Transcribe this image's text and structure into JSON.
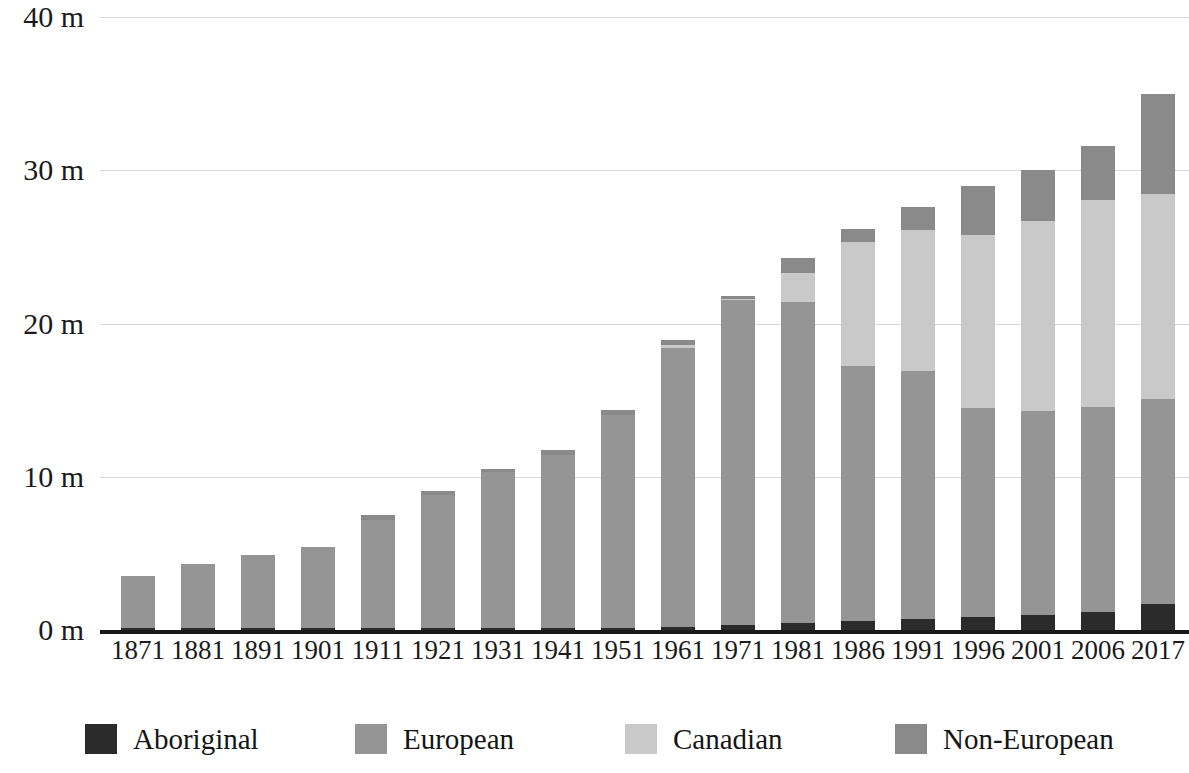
{
  "chart_data": {
    "type": "bar",
    "stacked": true,
    "title": "",
    "subtitle": "",
    "xlabel": "",
    "ylabel": "",
    "grid": true,
    "legend_position": "bottom",
    "ylim": [
      0,
      40
    ],
    "y_ticks": [
      0,
      10,
      20,
      30,
      40
    ],
    "y_tick_labels": [
      "0 m",
      "10 m",
      "20 m",
      "30 m",
      "40 m"
    ],
    "unit_note": "m = millions of people",
    "categories": [
      "1871",
      "1881",
      "1891",
      "1901",
      "1911",
      "1921",
      "1931",
      "1941",
      "1951",
      "1961",
      "1971",
      "1981",
      "1986",
      "1991",
      "1996",
      "2001",
      "2006",
      "2017"
    ],
    "series": [
      {
        "name": "Aboriginal",
        "color": "#2b2b2b",
        "values": [
          0.1,
          0.1,
          0.1,
          0.1,
          0.1,
          0.1,
          0.1,
          0.12,
          0.16,
          0.22,
          0.31,
          0.49,
          0.6,
          0.72,
          0.87,
          1.0,
          1.17,
          1.67
        ]
      },
      {
        "name": "European",
        "color": "#959595",
        "values": [
          3.4,
          4.2,
          4.8,
          5.3,
          7.1,
          8.7,
          10.2,
          11.3,
          13.9,
          18.2,
          21.2,
          20.9,
          16.6,
          16.2,
          13.6,
          13.3,
          13.4,
          13.4
        ]
      },
      {
        "name": "Canadian",
        "color": "#c9c9c9",
        "values": [
          0.0,
          0.0,
          0.0,
          0.0,
          0.0,
          0.0,
          0.0,
          0.0,
          0.0,
          0.2,
          0.1,
          1.9,
          8.1,
          9.2,
          11.3,
          12.4,
          13.5,
          13.4
        ]
      },
      {
        "name": "Non-European",
        "color": "#8a8a8a",
        "values": [
          0.0,
          0.0,
          0.0,
          0.0,
          0.3,
          0.3,
          0.2,
          0.3,
          0.3,
          0.3,
          0.2,
          1.0,
          0.9,
          1.5,
          3.2,
          3.3,
          3.5,
          6.5
        ]
      }
    ],
    "totals": [
      3.5,
      4.3,
      4.9,
      5.4,
      7.5,
      9.1,
      10.5,
      11.7,
      14.4,
      18.9,
      21.8,
      24.3,
      25.2,
      27.6,
      29.0,
      30.0,
      31.5,
      35.0
    ]
  },
  "legend": {
    "items": [
      {
        "label": "Aboriginal",
        "color": "#2b2b2b"
      },
      {
        "label": "European",
        "color": "#959595"
      },
      {
        "label": "Canadian",
        "color": "#c9c9c9"
      },
      {
        "label": "Non-European",
        "color": "#8a8a8a"
      }
    ]
  },
  "colors": {
    "background": "#ffffff",
    "gridline": "#d8d8d8",
    "axis": "#1a1a1a",
    "text": "#1b1b1b"
  }
}
